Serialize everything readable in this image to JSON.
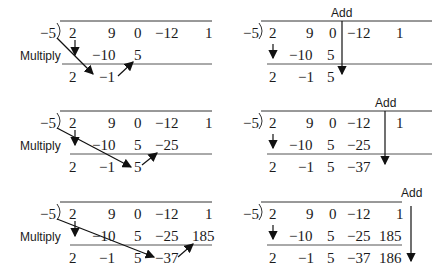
{
  "divisor": "−5",
  "labels": {
    "multiply": "Multiply",
    "add": "Add"
  },
  "coefficients": [
    "2",
    "9",
    "0",
    "−12",
    "1"
  ],
  "panels": [
    {
      "id": "step1-multiply",
      "action": "Multiply",
      "row2": [
        "",
        "−10",
        "5",
        "",
        ""
      ],
      "row3": [
        "2",
        "−1",
        "",
        "",
        ""
      ]
    },
    {
      "id": "step1-add",
      "action": "Add",
      "row2": [
        "",
        "−10",
        "5",
        "",
        ""
      ],
      "row3": [
        "2",
        "−1",
        "5",
        "",
        ""
      ]
    },
    {
      "id": "step2-multiply",
      "action": "Multiply",
      "row2": [
        "",
        "−10",
        "5",
        "−25",
        ""
      ],
      "row3": [
        "2",
        "−1",
        "5",
        "",
        ""
      ]
    },
    {
      "id": "step2-add",
      "action": "Add",
      "row2": [
        "",
        "−10",
        "5",
        "−25",
        ""
      ],
      "row3": [
        "2",
        "−1",
        "5",
        "−37",
        ""
      ]
    },
    {
      "id": "step3-multiply",
      "action": "Multiply",
      "row2": [
        "",
        "−10",
        "5",
        "−25",
        "185"
      ],
      "row3": [
        "2",
        "−1",
        "5",
        "−37",
        ""
      ]
    },
    {
      "id": "step3-add",
      "action": "Add",
      "row2": [
        "",
        "−10",
        "5",
        "−25",
        "185"
      ],
      "row3": [
        "2",
        "−1",
        "5",
        "−37",
        "186"
      ]
    }
  ]
}
